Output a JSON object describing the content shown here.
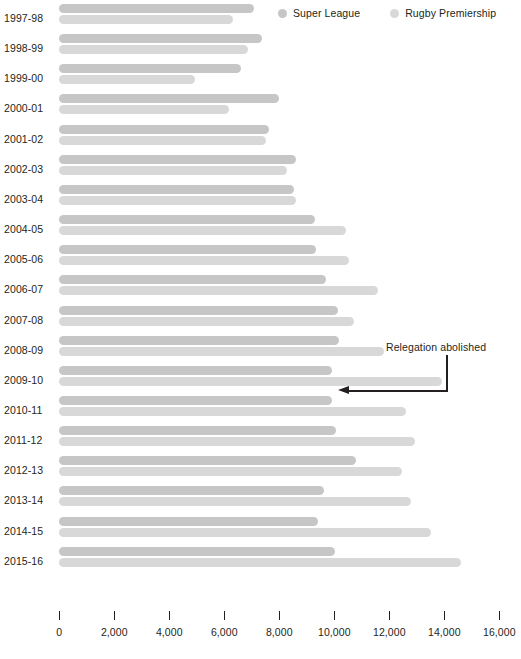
{
  "chart_data": {
    "type": "bar",
    "orientation": "horizontal",
    "title": "",
    "subtitle": "",
    "xlabel": "",
    "ylabel": "",
    "xlim": [
      0,
      16000
    ],
    "grid": false,
    "legend_position": "top-right",
    "xticks": [
      0,
      2000,
      4000,
      6000,
      8000,
      10000,
      12000,
      14000,
      16000
    ],
    "xtick_labels": [
      "0",
      "2,000",
      "4,000",
      "6,000",
      "8,000",
      "10,000",
      "12,000",
      "14,000",
      "16,000"
    ],
    "categories": [
      "1997-98",
      "1998-99",
      "1999-00",
      "2000-01",
      "2001-02",
      "2002-03",
      "2003-04",
      "2004-05",
      "2005-06",
      "2006-07",
      "2007-08",
      "2008-09",
      "2009-10",
      "2010-11",
      "2011-12",
      "2012-13",
      "2013-14",
      "2014-15",
      "2015-16"
    ],
    "series": [
      {
        "name": "Super League",
        "color": "#c6c6c6",
        "values": [
          7100,
          7400,
          6620,
          8020,
          7650,
          8650,
          8580,
          9310,
          9370,
          9720,
          10160,
          10190,
          9960,
          9950,
          10100,
          10830,
          9670,
          9430,
          10070
        ]
      },
      {
        "name": "Rugby Premiership",
        "color": "#d8d8d8",
        "values": [
          6350,
          6890,
          4980,
          6210,
          7530,
          8310,
          8620,
          10440,
          10570,
          11610,
          10740,
          11850,
          13930,
          12620,
          12980,
          12500,
          12830,
          13550,
          14640
        ]
      }
    ],
    "annotations": [
      {
        "text": "Relegation abolished",
        "points_to_category": "2009-10",
        "points_to_series": "Super League"
      }
    ]
  },
  "legend": {
    "items": [
      {
        "label": "Super League",
        "color": "#c6c6c6",
        "icon": "circle-swatch-icon"
      },
      {
        "label": "Rugby Premiership",
        "color": "#d8d8d8",
        "icon": "circle-swatch-icon"
      }
    ]
  },
  "annotation": {
    "label": "Relegation abolished"
  },
  "axis": {
    "title": ""
  }
}
